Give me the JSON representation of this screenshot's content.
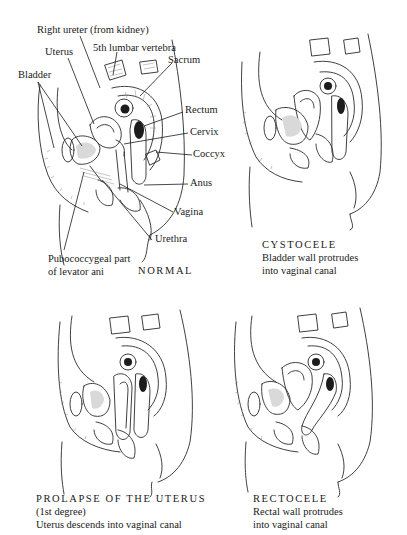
{
  "figure": {
    "panels": [
      {
        "id": "normal",
        "caption_title": "NORMAL",
        "labels": [
          "Right ureter (from kidney)",
          "5th lumbar vertebra",
          "Uterus",
          "Sacrum",
          "Bladder",
          "Rectum",
          "Cervix",
          "Coccyx",
          "Anus",
          "Vagina",
          "Urethra",
          "Pubococcygeal part",
          "of levator ani"
        ]
      },
      {
        "id": "cystocele",
        "caption_title": "CYSTOCELE",
        "caption_lines": [
          "Bladder wall protrudes",
          "into vaginal canal"
        ]
      },
      {
        "id": "prolapse",
        "caption_title": "PROLAPSE OF THE UTERUS",
        "caption_lines": [
          "(1st degree)",
          "Uterus descends into vaginal canal"
        ]
      },
      {
        "id": "rectocele",
        "caption_title": "RECTOCELE",
        "caption_lines": [
          "Rectal wall protrudes",
          "into vaginal canal"
        ]
      }
    ]
  }
}
